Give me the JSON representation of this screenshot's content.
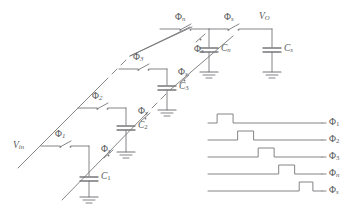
{
  "figure": {
    "type": "circuit-schematic",
    "line_color": "#77777a",
    "text_color": "#58585a"
  },
  "circuit": {
    "input_label": "V",
    "input_sub": "in",
    "output_label": "V",
    "output_sub": "O",
    "phi": "Φ",
    "stages": [
      {
        "id": "stage1",
        "series_switch": "Φ",
        "series_sub": "1",
        "diag_switch": "Φ",
        "diag_sub": "s",
        "cap": "C",
        "cap_sub": "1"
      },
      {
        "id": "stage2",
        "series_switch": "Φ",
        "series_sub": "2",
        "diag_switch": "Φ",
        "diag_sub": "s",
        "cap": "C",
        "cap_sub": "2"
      },
      {
        "id": "stage3",
        "series_switch": "Φ",
        "series_sub": "3",
        "diag_switch": "Φ",
        "diag_sub": "s",
        "cap": "C",
        "cap_sub": "3"
      },
      {
        "id": "stagen",
        "series_switch": "Φ",
        "series_sub": "n",
        "diag_switch": "Φ",
        "diag_sub": "s",
        "cap": "C",
        "cap_sub": "n"
      }
    ],
    "output_switch": {
      "label": "Φ",
      "sub": "s"
    },
    "output_cap": {
      "label": "C",
      "sub": "s"
    },
    "continuation": "dashed-ellipsis",
    "ground_symbol": "ground-icon"
  },
  "chart_data": {
    "type": "line",
    "title": "",
    "xlabel": "",
    "ylabel": "",
    "grid": false,
    "legend": "right",
    "xlim": [
      0,
      100
    ],
    "ylim": [
      0,
      1
    ],
    "note": "Non-overlapping clock phases; each trace is a single rectangular pulse stepping later in time",
    "series": [
      {
        "name": "Φ₁",
        "label": "Φ",
        "sub": "1",
        "pulse_start": 8,
        "pulse_end": 22,
        "low": 0,
        "high": 1
      },
      {
        "name": "Φ₂",
        "label": "Φ",
        "sub": "2",
        "pulse_start": 26,
        "pulse_end": 40,
        "low": 0,
        "high": 1
      },
      {
        "name": "Φ₃",
        "label": "Φ",
        "sub": "3",
        "pulse_start": 44,
        "pulse_end": 58,
        "low": 0,
        "high": 1
      },
      {
        "name": "Φₙ",
        "label": "Φ",
        "sub": "n",
        "pulse_start": 62,
        "pulse_end": 76,
        "low": 0,
        "high": 1
      },
      {
        "name": "Φₛ",
        "label": "Φ",
        "sub": "s",
        "pulse_start": 80,
        "pulse_end": 92,
        "low": 0,
        "high": 1
      }
    ]
  }
}
